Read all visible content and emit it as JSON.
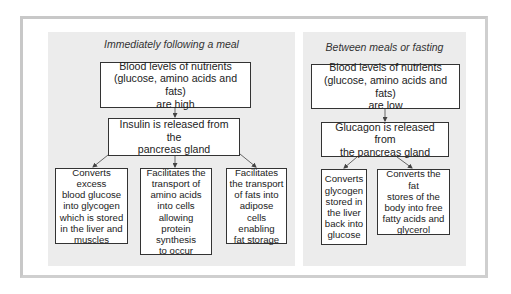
{
  "diagram": {
    "left_panel": {
      "title": "Immediately following a meal",
      "top_box": "Blood levels of nutrients\n(glucose, amino acids and fats)\nare high",
      "hormone_box": "Insulin is released from the\npancreas gland",
      "effects": [
        "Converts excess\nblood glucose\ninto glycogen\nwhich is stored\nin the liver and\nmuscles",
        "Facilitates the\ntransport of\namino acids\ninto cells\nallowing protein\nsynthesis\nto occur",
        "Facilitates\nthe transport\nof fats into\nadipose cells\nenabling\nfat storage"
      ]
    },
    "right_panel": {
      "title": "Between meals or fasting",
      "top_box": "Blood levels of nutrients\n(glucose, amino acids and fats)\nare low",
      "hormone_box": "Glucagon is released from\nthe pancreas gland",
      "effects": [
        "Converts\nglycogen\nstored in\nthe liver\nback into\nglucose",
        "Converts the fat\nstores of the\nbody into free\nfatty acids and\nglycerol"
      ]
    },
    "colors": {
      "panel_background": "#ececec",
      "box_border": "#333333",
      "arrow": "#555555",
      "frame": "#c8c8c8"
    }
  }
}
